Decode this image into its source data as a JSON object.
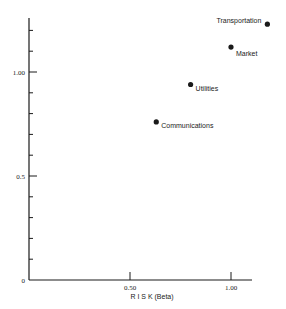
{
  "chart_data": {
    "type": "scatter",
    "title": "",
    "xlabel": "R I S K  (Beta)",
    "ylabel": "",
    "xlim": [
      0,
      1.1
    ],
    "ylim": [
      0,
      1.26
    ],
    "x_ticks": [
      {
        "value": 0.5,
        "label": "0.50"
      },
      {
        "value": 1.0,
        "label": "1.00"
      }
    ],
    "y_ticks": [
      {
        "value": 0,
        "label": "0"
      },
      {
        "value": 0.5,
        "label": "0.5"
      },
      {
        "value": 1.0,
        "label": "1.00"
      }
    ],
    "y_minor_tick_step": 0.1,
    "grid": false,
    "legend": "none",
    "points": [
      {
        "label": "Communications",
        "x": 0.63,
        "y": 0.76
      },
      {
        "label": "Utilities",
        "x": 0.8,
        "y": 0.94
      },
      {
        "label": "Market",
        "x": 1.0,
        "y": 1.12
      },
      {
        "label": "Transportation",
        "x": 1.18,
        "y": 1.23
      }
    ]
  },
  "colors": {
    "ink": "#1a1a1a",
    "background": "#ffffff"
  }
}
